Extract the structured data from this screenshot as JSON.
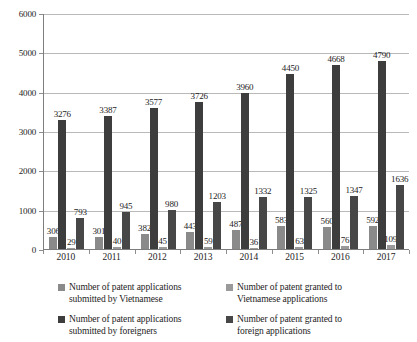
{
  "chart_data": {
    "type": "bar",
    "title": "",
    "subtitle": "",
    "xlabel": "",
    "ylabel": "",
    "categories": [
      "2010",
      "2011",
      "2012",
      "2013",
      "2014",
      "2015",
      "2016",
      "2017"
    ],
    "ylim": [
      0,
      6000
    ],
    "ytick_labels": [
      "0",
      "1000",
      "2000",
      "3000",
      "4000",
      "5000",
      "6000"
    ],
    "ytick_values": [
      0,
      1000,
      2000,
      3000,
      4000,
      5000,
      6000
    ],
    "grid": true,
    "legend_position": "bottom",
    "series": [
      {
        "name": "Number of patent applications submitted by Vietnamese",
        "color": "#8a8a8a",
        "values": [
          306,
          301,
          382,
          443,
          487,
          583,
          560,
          592
        ]
      },
      {
        "name": "Number of patent applications submitted by foreigners",
        "color": "#3d3d3d",
        "values": [
          3276,
          3387,
          3577,
          3726,
          3960,
          4450,
          4668,
          4790
        ]
      },
      {
        "name": "Number of patent granted to Vietnamese applications",
        "color": "#9a9a9a",
        "values": [
          29,
          40,
          45,
          59,
          36,
          63,
          76,
          109
        ]
      },
      {
        "name": "Number of patent granted to foreign applications",
        "color": "#474747",
        "values": [
          793,
          945,
          980,
          1203,
          1332,
          1325,
          1347,
          1636
        ]
      }
    ]
  },
  "legend": {
    "items": [
      {
        "label_line1": "Number of patent applications",
        "label_line2": "submitted by Vietnamese",
        "color": "#8a8a8a"
      },
      {
        "label_line1": "Number of patent granted to",
        "label_line2": "Vietnamese applications",
        "color": "#9a9a9a"
      },
      {
        "label_line1": "Number of patent applications",
        "label_line2": "submitted by foreigners",
        "color": "#3d3d3d"
      },
      {
        "label_line1": "Number of patent granted to",
        "label_line2": "foreign applications",
        "color": "#474747"
      }
    ]
  },
  "colors": {
    "axis": "#7d7d7d",
    "gridline": "#b9b9b9",
    "text": "#1d1d1d",
    "background": "#ffffff"
  }
}
